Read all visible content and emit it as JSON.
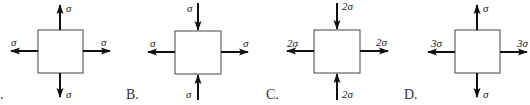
{
  "options": [
    {
      "id": "A",
      "label": ".",
      "box": {
        "x": 38,
        "y": 30,
        "w": 45,
        "h": 43
      },
      "top": {
        "dir": "out",
        "text": "σ"
      },
      "bottom": {
        "dir": "out",
        "text": "σ"
      },
      "left": {
        "dir": "out",
        "text": "σ"
      },
      "right": {
        "dir": "out",
        "text": "σ"
      }
    },
    {
      "id": "B",
      "label": "B.",
      "box": {
        "x": 175,
        "y": 31,
        "w": 46,
        "h": 43
      },
      "top": {
        "dir": "in",
        "text": "σ"
      },
      "bottom": {
        "dir": "in",
        "text": "σ"
      },
      "left": {
        "dir": "out",
        "text": "σ"
      },
      "right": {
        "dir": "out",
        "text": "σ"
      }
    },
    {
      "id": "C",
      "label": "C.",
      "box": {
        "x": 314,
        "y": 30,
        "w": 46,
        "h": 43
      },
      "top": {
        "dir": "in",
        "text": "2σ"
      },
      "bottom": {
        "dir": "in",
        "text": "2σ"
      },
      "left": {
        "dir": "out",
        "text": "2σ"
      },
      "right": {
        "dir": "out",
        "text": "2σ"
      }
    },
    {
      "id": "D",
      "label": "D.",
      "box": {
        "x": 455,
        "y": 30,
        "w": 45,
        "h": 43
      },
      "top": {
        "dir": "out",
        "text": "σ"
      },
      "bottom": {
        "dir": "out",
        "text": "σ"
      },
      "left": {
        "dir": "out",
        "text": "3σ"
      },
      "right": {
        "dir": "out",
        "text": "3σ"
      }
    }
  ],
  "colors": {
    "stroke": "#333333",
    "arrow": "#111111"
  }
}
